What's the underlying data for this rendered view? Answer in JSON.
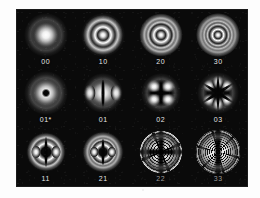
{
  "figure": {
    "type": "mode-pattern-grid",
    "background_color": "#0a0a0a",
    "label_color": "#e6e6e6",
    "page_color": "#ffffff",
    "rows": 3,
    "columns": 4
  },
  "modes": [
    {
      "label": "00",
      "row": 1,
      "column": 1,
      "pattern": "gaussian-spot",
      "rings": 0,
      "lobes": 1
    },
    {
      "label": "10",
      "row": 1,
      "column": 2,
      "pattern": "concentric-rings",
      "rings": 1,
      "lobes": 1
    },
    {
      "label": "20",
      "row": 1,
      "column": 3,
      "pattern": "concentric-rings",
      "rings": 2,
      "lobes": 1
    },
    {
      "label": "30",
      "row": 1,
      "column": 4,
      "pattern": "concentric-rings",
      "rings": 3,
      "lobes": 1
    },
    {
      "label": "01*",
      "row": 2,
      "column": 1,
      "pattern": "donut-ring",
      "rings": 1,
      "lobes": 0
    },
    {
      "label": "01",
      "row": 2,
      "column": 2,
      "pattern": "two-lobe",
      "rings": 0,
      "lobes": 2
    },
    {
      "label": "02",
      "row": 2,
      "column": 3,
      "pattern": "four-lobe",
      "rings": 0,
      "lobes": 4
    },
    {
      "label": "03",
      "row": 2,
      "column": 4,
      "pattern": "six-lobe",
      "rings": 0,
      "lobes": 6
    },
    {
      "label": "11",
      "row": 3,
      "column": 1,
      "pattern": "two-lobe-with-ring",
      "rings": 1,
      "lobes": 2
    },
    {
      "label": "21",
      "row": 3,
      "column": 2,
      "pattern": "two-lobe-with-rings",
      "rings": 2,
      "lobes": 2
    },
    {
      "label": "22",
      "row": 3,
      "column": 3,
      "pattern": "four-lobe-with-rings",
      "rings": 2,
      "lobes": 4
    },
    {
      "label": "33",
      "row": 3,
      "column": 4,
      "pattern": "six-lobe-with-rings",
      "rings": 3,
      "lobes": 6
    }
  ]
}
